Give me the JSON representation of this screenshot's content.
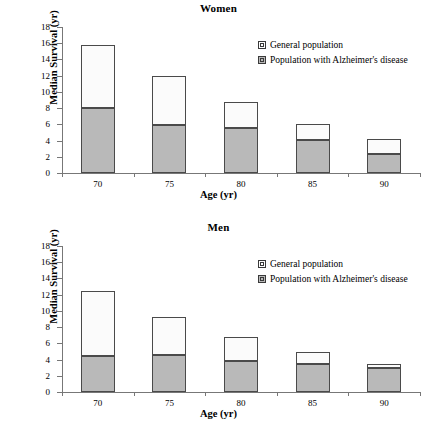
{
  "figure": {
    "legend": {
      "general_label": "General population",
      "alz_label": "Population with Alzheimer's disease",
      "general_color": "#ffffff",
      "alz_color": "#b9b9b9"
    }
  },
  "chart_data": [
    {
      "type": "bar",
      "stacked": true,
      "title": "Women",
      "xlabel": "Age (yr)",
      "ylabel": "Median Survival (yr)",
      "categories": [
        "70",
        "75",
        "80",
        "85",
        "90"
      ],
      "ylim": [
        0,
        18
      ],
      "yticks": [
        0,
        2,
        4,
        6,
        8,
        10,
        12,
        14,
        16,
        18
      ],
      "grid": false,
      "legend_position": "upper-right-inside",
      "series": [
        {
          "name": "Population with Alzheimer's disease",
          "values": [
            8.0,
            5.9,
            5.5,
            4.1,
            2.3
          ]
        },
        {
          "name": "General population",
          "values": [
            15.8,
            12.0,
            8.8,
            6.1,
            4.2
          ]
        }
      ]
    },
    {
      "type": "bar",
      "stacked": true,
      "title": "Men",
      "xlabel": "Age (yr)",
      "ylabel": "Median Survival (yr)",
      "categories": [
        "70",
        "75",
        "80",
        "85",
        "90"
      ],
      "ylim": [
        0,
        18
      ],
      "yticks": [
        0,
        2,
        4,
        6,
        8,
        10,
        12,
        14,
        16,
        18
      ],
      "grid": false,
      "legend_position": "upper-right-inside",
      "series": [
        {
          "name": "Population with Alzheimer's disease",
          "values": [
            4.5,
            4.6,
            3.8,
            3.5,
            3.0
          ]
        },
        {
          "name": "General population",
          "values": [
            12.5,
            9.3,
            6.8,
            4.9,
            3.5
          ]
        }
      ]
    }
  ]
}
